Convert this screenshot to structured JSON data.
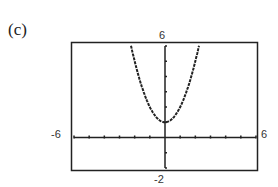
{
  "panel_label": "(c)",
  "window": {
    "xmin": "-6",
    "xmax": "6",
    "ymin": "-2",
    "ymax": "6"
  },
  "chart_data": {
    "type": "line",
    "title": "(c)",
    "function": "y = x^2 + 1",
    "xlim": [
      -6,
      6
    ],
    "ylim": [
      -2,
      6
    ],
    "xtick_step": 1,
    "ytick_step": 1,
    "tick_labels": {
      "left": "-6",
      "right": "6",
      "top": "6",
      "bottom": "-2"
    },
    "series": [
      {
        "name": "f(x)",
        "x": [
          -2.24,
          -2,
          -1.5,
          -1,
          -0.5,
          0,
          0.5,
          1,
          1.5,
          2,
          2.24
        ],
        "y": [
          6,
          5,
          3.25,
          2,
          1.25,
          1,
          1.25,
          2,
          3.25,
          5,
          6
        ]
      }
    ],
    "grid": false,
    "legend": null
  }
}
